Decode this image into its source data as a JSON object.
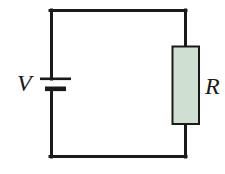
{
  "figure": {
    "name": "series-circuit-diagram",
    "type": "schematic",
    "width": 225,
    "height": 174,
    "background_color": "#ffffff"
  },
  "colors": {
    "wire": "#1a1a1a",
    "resistor_fill": "#cfe0d3",
    "resistor_border": "#1a1a1a",
    "label_text": "#1a1a1a"
  },
  "circuit": {
    "loop": {
      "left_x": 51,
      "right_x": 185,
      "top_y": 10,
      "bottom_y": 157,
      "stroke_width": 3
    },
    "battery": {
      "label": "V",
      "position": "left-branch",
      "long_plate": {
        "x1": 40,
        "x2": 71,
        "y": 79,
        "thickness": 2
      },
      "short_plate": {
        "x1": 45,
        "x2": 66,
        "y": 89,
        "thickness": 5
      }
    },
    "resistor": {
      "label": "R",
      "position": "right-branch",
      "x": 172,
      "y": 46,
      "width": 27,
      "height": 78,
      "fill": "#cfe0d3",
      "border": "#1a1a1a"
    }
  },
  "labels": {
    "voltage": "V",
    "resistance": "R"
  }
}
